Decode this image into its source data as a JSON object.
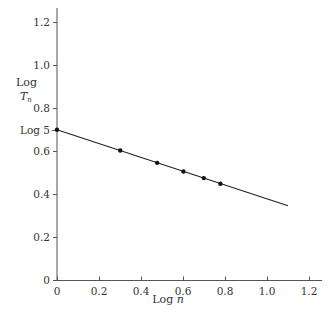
{
  "chart_data": {
    "type": "line",
    "title": "",
    "xlabel": "Log n",
    "ylabel": "Log T_n",
    "xlim": [
      0,
      1.25
    ],
    "ylim": [
      0,
      1.28
    ],
    "grid": false,
    "x_ticks": [
      "0",
      "0.2",
      "0.4",
      "0.6",
      "0.8",
      "1.0",
      "1.2"
    ],
    "y_ticks": [
      "0",
      "0.2",
      "0.4",
      "0.6",
      "0.8",
      "1.0",
      "1.2"
    ],
    "y_annotation": "Log 5",
    "series": [
      {
        "name": "fitted line",
        "x": [
          0,
          1.1
        ],
        "y": [
          0.699,
          0.345
        ]
      },
      {
        "name": "data points",
        "x": [
          0,
          0.301,
          0.477,
          0.602,
          0.699,
          0.778
        ],
        "y": [
          0.699,
          0.602,
          0.545,
          0.505,
          0.474,
          0.448
        ]
      }
    ]
  },
  "labels": {
    "xlabel_main": "Log ",
    "xlabel_var": "n",
    "ylabel_line1": "Log",
    "ylabel_var": "T",
    "ylabel_sub": "n",
    "log5": "Log 5"
  }
}
